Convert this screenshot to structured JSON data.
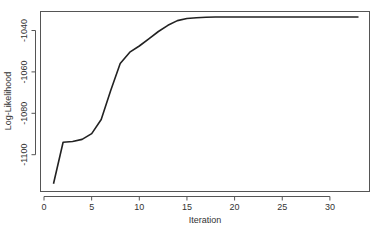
{
  "chart_data": {
    "type": "line",
    "title": "",
    "xlabel": "Iteration",
    "ylabel": "Log-Likelihood",
    "xlim": [
      0,
      33
    ],
    "ylim": [
      -1115,
      -1033
    ],
    "x_ticks": [
      0,
      5,
      10,
      15,
      20,
      25,
      30
    ],
    "y_ticks": [
      -1100,
      -1080,
      -1060,
      -1040
    ],
    "grid": false,
    "legend": null,
    "series": [
      {
        "name": "log-likelihood",
        "color": "#222222",
        "x": [
          1,
          2,
          3,
          4,
          5,
          6,
          7,
          8,
          9,
          10,
          11,
          12,
          13,
          14,
          15,
          16,
          17,
          18,
          19,
          20,
          21,
          22,
          23,
          24,
          25,
          26,
          27,
          28,
          29,
          30,
          31,
          32,
          33
        ],
        "values": [
          -1114,
          -1094,
          -1093.6,
          -1092.6,
          -1089.8,
          -1083,
          -1069,
          -1056,
          -1050.5,
          -1047.5,
          -1044,
          -1040.5,
          -1037.5,
          -1035.2,
          -1034.2,
          -1033.8,
          -1033.6,
          -1033.5,
          -1033.5,
          -1033.5,
          -1033.5,
          -1033.5,
          -1033.5,
          -1033.5,
          -1033.5,
          -1033.5,
          -1033.5,
          -1033.5,
          -1033.5,
          -1033.5,
          -1033.5,
          -1033.5,
          -1033.5
        ]
      }
    ]
  },
  "labels": {
    "xlabel": "Iteration",
    "ylabel": "Log-Likelihood"
  }
}
